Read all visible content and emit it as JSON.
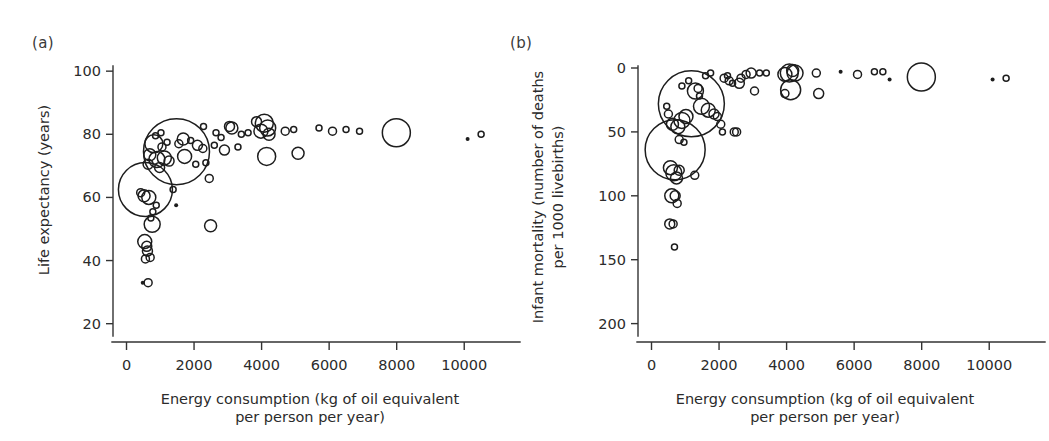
{
  "figure": {
    "background": "#ffffff",
    "ink": "#1d1d1d",
    "panels": [
      "(a)",
      "(b)"
    ]
  },
  "panel_a": {
    "label": "(a)",
    "ylabel": "Life expectancy (years)",
    "xlabel_line1": "Energy consumption (kg of oil equivalent",
    "xlabel_line2": "per person per year)",
    "yticks": [
      "20",
      "40",
      "60",
      "80",
      "100"
    ],
    "xticks": [
      "0",
      "2000",
      "4000",
      "6000",
      "8000",
      "10000"
    ]
  },
  "panel_b": {
    "label": "(b)",
    "ylabel_line1": "Infant mortality (number of deaths",
    "ylabel_line2": "per 1000 livebirths)",
    "xlabel_line1": "Energy consumption (kg of oil equivalent",
    "xlabel_line2": "per person per year)",
    "yticks": [
      "0",
      "50",
      "100",
      "150",
      "200"
    ],
    "xticks": [
      "0",
      "2000",
      "4000",
      "6000",
      "8000",
      "10000"
    ]
  },
  "chart_data": [
    {
      "type": "scatter",
      "panel": "(a)",
      "title": "",
      "xlabel": "Energy consumption (kg of oil equivalent per person per year)",
      "ylabel": "Life expectancy (years)",
      "xlim": [
        -400,
        11000
      ],
      "ylim": [
        18,
        101
      ],
      "xticks": [
        0,
        2000,
        4000,
        6000,
        8000,
        10000
      ],
      "yticks": [
        20,
        40,
        60,
        80,
        100
      ],
      "grid": false,
      "legend": "none",
      "size_encoding": "population (bubble area)",
      "points": [
        {
          "x": 1480,
          "y": 74.5,
          "r": 33
        },
        {
          "x": 560,
          "y": 62.5,
          "r": 27
        },
        {
          "x": 7990,
          "y": 80.5,
          "r": 14
        },
        {
          "x": 4080,
          "y": 83.5,
          "r": 9
        },
        {
          "x": 4180,
          "y": 82.0,
          "r": 8
        },
        {
          "x": 4150,
          "y": 73.0,
          "r": 9
        },
        {
          "x": 3980,
          "y": 81.0,
          "r": 7
        },
        {
          "x": 4220,
          "y": 80.0,
          "r": 6
        },
        {
          "x": 810,
          "y": 77.0,
          "r": 9
        },
        {
          "x": 1120,
          "y": 72.5,
          "r": 7
        },
        {
          "x": 900,
          "y": 72.0,
          "r": 8
        },
        {
          "x": 1260,
          "y": 71.5,
          "r": 5
        },
        {
          "x": 690,
          "y": 73.5,
          "r": 6
        },
        {
          "x": 640,
          "y": 70.5,
          "r": 5
        },
        {
          "x": 980,
          "y": 69.5,
          "r": 5
        },
        {
          "x": 520,
          "y": 60.5,
          "r": 6
        },
        {
          "x": 660,
          "y": 60.0,
          "r": 7
        },
        {
          "x": 420,
          "y": 61.5,
          "r": 4
        },
        {
          "x": 760,
          "y": 51.5,
          "r": 8
        },
        {
          "x": 2490,
          "y": 51.0,
          "r": 6
        },
        {
          "x": 540,
          "y": 46.0,
          "r": 7
        },
        {
          "x": 600,
          "y": 44.5,
          "r": 5
        },
        {
          "x": 620,
          "y": 43.0,
          "r": 5
        },
        {
          "x": 700,
          "y": 41.0,
          "r": 4
        },
        {
          "x": 560,
          "y": 40.5,
          "r": 4
        },
        {
          "x": 640,
          "y": 33.0,
          "r": 4
        },
        {
          "x": 480,
          "y": 33.0,
          "r": 2
        },
        {
          "x": 5080,
          "y": 74.0,
          "r": 6
        },
        {
          "x": 1720,
          "y": 73.0,
          "r": 7
        },
        {
          "x": 1680,
          "y": 78.5,
          "r": 6
        },
        {
          "x": 2450,
          "y": 66.0,
          "r": 4
        },
        {
          "x": 2100,
          "y": 76.5,
          "r": 5
        },
        {
          "x": 2260,
          "y": 75.5,
          "r": 4
        },
        {
          "x": 2900,
          "y": 75.0,
          "r": 5
        },
        {
          "x": 3120,
          "y": 82.0,
          "r": 6
        },
        {
          "x": 3050,
          "y": 82.5,
          "r": 5
        },
        {
          "x": 2280,
          "y": 82.5,
          "r": 3
        },
        {
          "x": 2650,
          "y": 80.5,
          "r": 3
        },
        {
          "x": 2800,
          "y": 79.0,
          "r": 3
        },
        {
          "x": 3400,
          "y": 80.0,
          "r": 3
        },
        {
          "x": 3600,
          "y": 80.5,
          "r": 3
        },
        {
          "x": 4700,
          "y": 81.0,
          "r": 4
        },
        {
          "x": 4950,
          "y": 81.5,
          "r": 3
        },
        {
          "x": 5700,
          "y": 82.0,
          "r": 3
        },
        {
          "x": 6100,
          "y": 81.0,
          "r": 4
        },
        {
          "x": 6500,
          "y": 81.5,
          "r": 3
        },
        {
          "x": 6900,
          "y": 81.0,
          "r": 3
        },
        {
          "x": 10100,
          "y": 78.5,
          "r": 2
        },
        {
          "x": 10500,
          "y": 80.0,
          "r": 3
        },
        {
          "x": 1380,
          "y": 62.5,
          "r": 3
        },
        {
          "x": 1470,
          "y": 57.5,
          "r": 2
        },
        {
          "x": 880,
          "y": 57.5,
          "r": 3
        },
        {
          "x": 780,
          "y": 55.5,
          "r": 3
        },
        {
          "x": 720,
          "y": 53.5,
          "r": 3
        },
        {
          "x": 1050,
          "y": 76.0,
          "r": 4
        },
        {
          "x": 1200,
          "y": 77.5,
          "r": 3
        },
        {
          "x": 1550,
          "y": 77.0,
          "r": 4
        },
        {
          "x": 1900,
          "y": 78.0,
          "r": 3
        },
        {
          "x": 2050,
          "y": 70.5,
          "r": 3
        },
        {
          "x": 2350,
          "y": 71.0,
          "r": 3
        },
        {
          "x": 2600,
          "y": 76.5,
          "r": 3
        },
        {
          "x": 3300,
          "y": 76.0,
          "r": 3
        },
        {
          "x": 860,
          "y": 79.5,
          "r": 3
        },
        {
          "x": 1020,
          "y": 80.5,
          "r": 3
        },
        {
          "x": 3850,
          "y": 84.0,
          "r": 5
        }
      ]
    },
    {
      "type": "scatter",
      "panel": "(b)",
      "title": "",
      "xlabel": "Energy consumption (kg of oil equivalent per person per year)",
      "ylabel": "Infant mortality (number of deaths per 1000 livebirths)",
      "xlim": [
        -400,
        11000
      ],
      "ylim": [
        0,
        205
      ],
      "y_inverted": true,
      "xticks": [
        0,
        2000,
        4000,
        6000,
        8000,
        10000
      ],
      "yticks": [
        0,
        50,
        100,
        150,
        200
      ],
      "grid": false,
      "legend": "none",
      "size_encoding": "population (bubble area)",
      "points": [
        {
          "x": 1180,
          "y": 28,
          "r": 33
        },
        {
          "x": 700,
          "y": 64,
          "r": 30
        },
        {
          "x": 7990,
          "y": 7,
          "r": 14
        },
        {
          "x": 4120,
          "y": 17,
          "r": 10
        },
        {
          "x": 4080,
          "y": 4,
          "r": 9
        },
        {
          "x": 4250,
          "y": 4,
          "r": 8
        },
        {
          "x": 3950,
          "y": 5,
          "r": 7
        },
        {
          "x": 4180,
          "y": 2,
          "r": 6
        },
        {
          "x": 900,
          "y": 41,
          "r": 8
        },
        {
          "x": 1020,
          "y": 38,
          "r": 7
        },
        {
          "x": 780,
          "y": 46,
          "r": 7
        },
        {
          "x": 620,
          "y": 44,
          "r": 6
        },
        {
          "x": 1480,
          "y": 30,
          "r": 8
        },
        {
          "x": 1680,
          "y": 33,
          "r": 7
        },
        {
          "x": 1850,
          "y": 36,
          "r": 5
        },
        {
          "x": 1300,
          "y": 18,
          "r": 8
        },
        {
          "x": 560,
          "y": 78,
          "r": 7
        },
        {
          "x": 660,
          "y": 82,
          "r": 8
        },
        {
          "x": 740,
          "y": 86,
          "r": 6
        },
        {
          "x": 820,
          "y": 80,
          "r": 5
        },
        {
          "x": 600,
          "y": 100,
          "r": 7
        },
        {
          "x": 700,
          "y": 100,
          "r": 5
        },
        {
          "x": 760,
          "y": 106,
          "r": 4
        },
        {
          "x": 540,
          "y": 122,
          "r": 5
        },
        {
          "x": 640,
          "y": 122,
          "r": 4
        },
        {
          "x": 680,
          "y": 140,
          "r": 3
        },
        {
          "x": 1280,
          "y": 84,
          "r": 4
        },
        {
          "x": 2050,
          "y": 44,
          "r": 4
        },
        {
          "x": 2100,
          "y": 50,
          "r": 3
        },
        {
          "x": 2450,
          "y": 50,
          "r": 4
        },
        {
          "x": 2520,
          "y": 50,
          "r": 4
        },
        {
          "x": 1950,
          "y": 38,
          "r": 4
        },
        {
          "x": 2600,
          "y": 12,
          "r": 5
        },
        {
          "x": 2650,
          "y": 8,
          "r": 4
        },
        {
          "x": 3050,
          "y": 18,
          "r": 4
        },
        {
          "x": 3950,
          "y": 20,
          "r": 4
        },
        {
          "x": 4950,
          "y": 20,
          "r": 5
        },
        {
          "x": 4880,
          "y": 4,
          "r": 4
        },
        {
          "x": 5600,
          "y": 3,
          "r": 2
        },
        {
          "x": 6100,
          "y": 5,
          "r": 4
        },
        {
          "x": 6600,
          "y": 3,
          "r": 3
        },
        {
          "x": 6850,
          "y": 3,
          "r": 3
        },
        {
          "x": 7050,
          "y": 9,
          "r": 2
        },
        {
          "x": 10100,
          "y": 9,
          "r": 2
        },
        {
          "x": 10500,
          "y": 8,
          "r": 3
        },
        {
          "x": 1600,
          "y": 6,
          "r": 3
        },
        {
          "x": 1750,
          "y": 4,
          "r": 3
        },
        {
          "x": 2150,
          "y": 8,
          "r": 4
        },
        {
          "x": 2250,
          "y": 6,
          "r": 3
        },
        {
          "x": 2300,
          "y": 10,
          "r": 4
        },
        {
          "x": 2400,
          "y": 12,
          "r": 3
        },
        {
          "x": 2800,
          "y": 5,
          "r": 4
        },
        {
          "x": 2950,
          "y": 4,
          "r": 5
        },
        {
          "x": 3200,
          "y": 4,
          "r": 3
        },
        {
          "x": 3400,
          "y": 4,
          "r": 3
        },
        {
          "x": 1100,
          "y": 10,
          "r": 3
        },
        {
          "x": 900,
          "y": 14,
          "r": 3
        },
        {
          "x": 1380,
          "y": 16,
          "r": 4
        },
        {
          "x": 1420,
          "y": 22,
          "r": 3
        },
        {
          "x": 500,
          "y": 36,
          "r": 4
        },
        {
          "x": 450,
          "y": 30,
          "r": 3
        },
        {
          "x": 820,
          "y": 56,
          "r": 4
        },
        {
          "x": 960,
          "y": 58,
          "r": 3
        }
      ]
    }
  ]
}
